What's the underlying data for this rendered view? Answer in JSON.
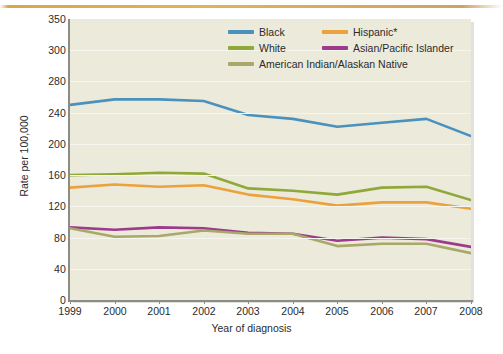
{
  "figure": {
    "top_rule_color": "#d8a23c",
    "plot_background": "#eceadb"
  },
  "chart_data": {
    "type": "line",
    "title": "",
    "xlabel": "Year of diagnosis",
    "ylabel": "Rate per 100,000",
    "x": [
      1999,
      2000,
      2001,
      2002,
      2003,
      2004,
      2005,
      2006,
      2007,
      2008
    ],
    "xtick_labels": [
      "1999",
      "2000",
      "2001",
      "2002",
      "2003",
      "2004",
      "2005",
      "2006",
      "2007",
      "2008"
    ],
    "ytick_labels": [
      "350",
      "300",
      "280",
      "240",
      "200",
      "160",
      "120",
      "80",
      "40",
      "0"
    ],
    "ytick_values": [
      350,
      300,
      280,
      240,
      200,
      160,
      120,
      80,
      40,
      0
    ],
    "ylim": [
      0,
      350
    ],
    "grid": true,
    "legend_position": "top-right-inside",
    "series": [
      {
        "name": "Black",
        "color": "#4a91bd",
        "values": [
          250,
          257,
          257,
          255,
          237,
          232,
          222,
          227,
          232,
          210
        ]
      },
      {
        "name": "Hispanic*",
        "color": "#eda13c",
        "values": [
          144,
          148,
          145,
          147,
          135,
          129,
          121,
          125,
          125,
          117
        ]
      },
      {
        "name": "White",
        "color": "#8fa939",
        "values": [
          160,
          161,
          163,
          162,
          143,
          140,
          135,
          144,
          145,
          128
        ]
      },
      {
        "name": "Asian/Pacific Islander",
        "color": "#9c3a8c",
        "values": [
          93,
          90,
          93,
          92,
          86,
          85,
          76,
          80,
          78,
          68
        ]
      },
      {
        "name": "American Indian/Alaskan Native",
        "color": "#a8a86a",
        "values": [
          92,
          81,
          82,
          89,
          85,
          85,
          69,
          72,
          72,
          60
        ]
      }
    ]
  },
  "legend": {
    "rows": [
      [
        {
          "label": "Black",
          "color": "#4a91bd"
        },
        {
          "label": "Hispanic*",
          "color": "#eda13c"
        }
      ],
      [
        {
          "label": "White",
          "color": "#8fa939"
        },
        {
          "label": "Asian/Pacific Islander",
          "color": "#9c3a8c"
        }
      ],
      [
        {
          "label": "American Indian/Alaskan Native",
          "color": "#a8a86a"
        }
      ]
    ]
  }
}
